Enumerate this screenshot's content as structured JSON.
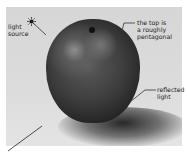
{
  "figure": {
    "annotations": {
      "light_source": [
        "light",
        "source"
      ],
      "top_shape": [
        "the top is",
        "a roughly",
        "pentagonal"
      ],
      "reflected_light": [
        "reflected",
        "light"
      ]
    },
    "icons": {
      "light_source_icon": "sun-icon"
    },
    "colors": {
      "background": "#d9d9d9",
      "apple_dark": "#1c1c1c",
      "leader_line": "#333333"
    }
  }
}
